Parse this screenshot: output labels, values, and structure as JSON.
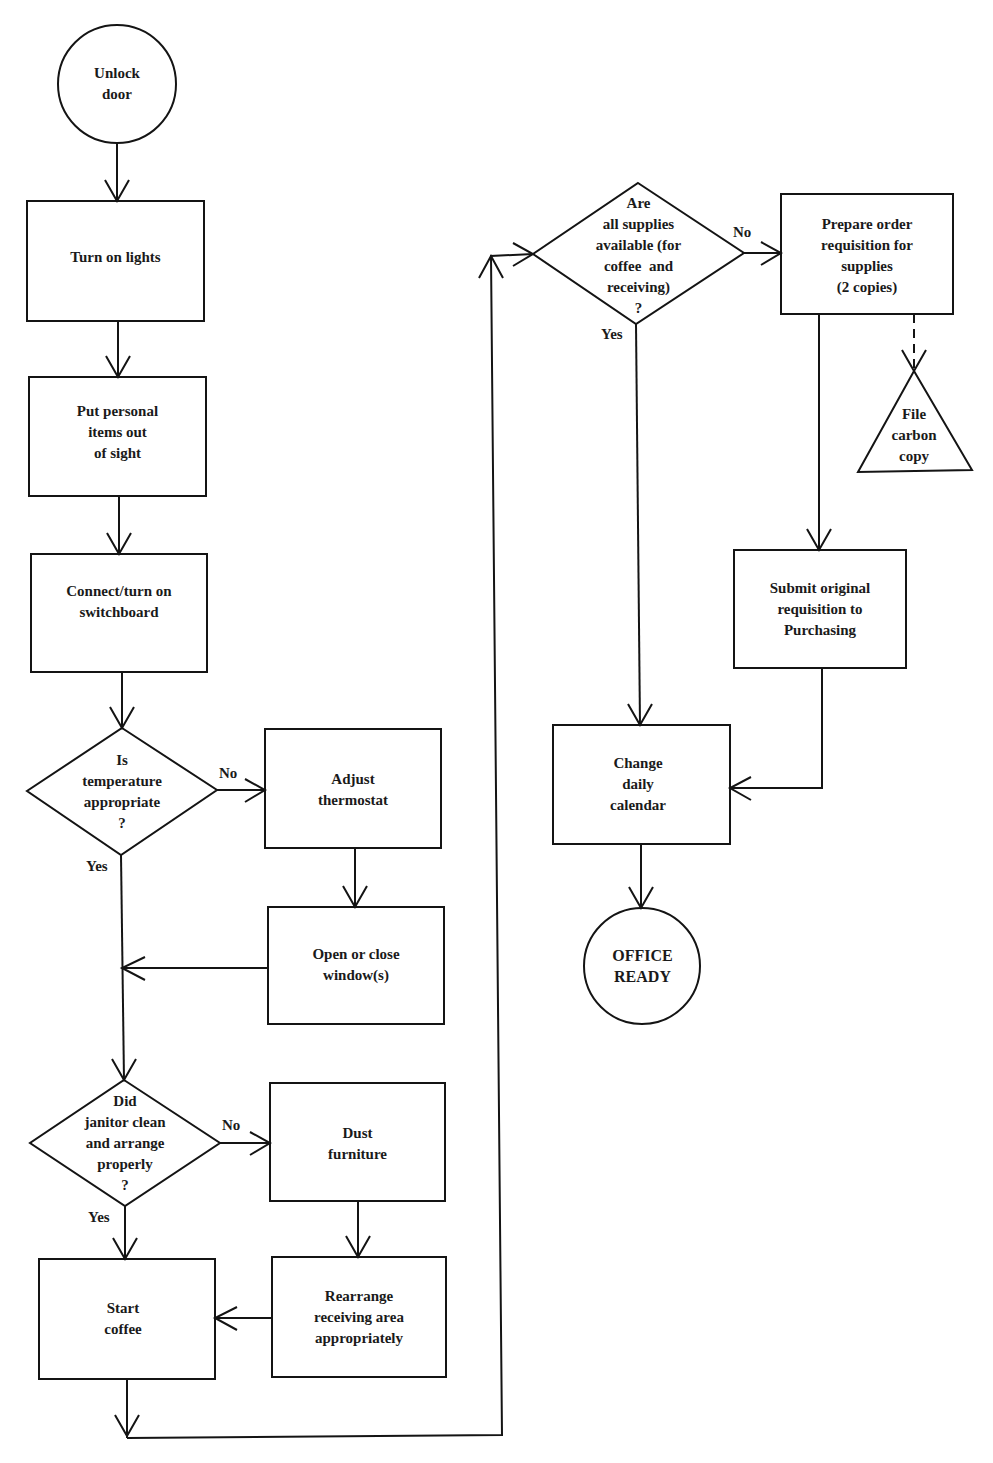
{
  "colors": {
    "ink": "#141414",
    "background": "#ffffff"
  },
  "nodes": {
    "unlock_door": {
      "type": "terminal",
      "lines": [
        "Unlock",
        "door"
      ]
    },
    "turn_on_lights": {
      "type": "process",
      "lines": [
        "Turn on lights"
      ]
    },
    "put_personal_items": {
      "type": "process",
      "lines": [
        "Put personal",
        "items out",
        "of sight"
      ]
    },
    "connect_switchboard": {
      "type": "process",
      "lines": [
        "Connect/turn on",
        "switchboard"
      ]
    },
    "temperature_decision": {
      "type": "decision",
      "lines": [
        "Is",
        "temperature",
        "appropriate",
        "?"
      ]
    },
    "adjust_thermostat": {
      "type": "process",
      "lines": [
        "Adjust",
        "thermostat"
      ]
    },
    "open_close_windows": {
      "type": "process",
      "lines": [
        "Open or close",
        "window(s)"
      ]
    },
    "janitor_decision": {
      "type": "decision",
      "lines": [
        "Did",
        "janitor clean",
        "and arrange",
        "properly",
        "?"
      ]
    },
    "dust_furniture": {
      "type": "process",
      "lines": [
        "Dust",
        "furniture"
      ]
    },
    "rearrange_receiving": {
      "type": "process",
      "lines": [
        "Rearrange",
        "receiving area",
        "appropriately"
      ]
    },
    "start_coffee": {
      "type": "process",
      "lines": [
        "Start",
        "coffee"
      ]
    },
    "supplies_decision": {
      "type": "decision",
      "lines": [
        "Are",
        "all supplies",
        "available (for",
        "coffee  and",
        "receiving)",
        "?"
      ]
    },
    "prepare_requisition": {
      "type": "process",
      "lines": [
        "Prepare order",
        "requisition for",
        "supplies",
        "(2 copies)"
      ]
    },
    "file_carbon_copy": {
      "type": "file",
      "lines": [
        "File",
        "carbon",
        "copy"
      ]
    },
    "submit_requisition": {
      "type": "process",
      "lines": [
        "Submit original",
        "requisition to",
        "Purchasing"
      ]
    },
    "change_calendar": {
      "type": "process",
      "lines": [
        "Change",
        "daily",
        "calendar"
      ]
    },
    "office_ready": {
      "type": "terminal",
      "lines": [
        "OFFICE",
        "READY"
      ]
    }
  },
  "edge_labels": {
    "temp_no": "No",
    "temp_yes": "Yes",
    "janitor_no": "No",
    "janitor_yes": "Yes",
    "supplies_no": "No",
    "supplies_yes": "Yes"
  },
  "edges": [
    {
      "from": "unlock_door",
      "to": "turn_on_lights"
    },
    {
      "from": "turn_on_lights",
      "to": "put_personal_items"
    },
    {
      "from": "put_personal_items",
      "to": "connect_switchboard"
    },
    {
      "from": "connect_switchboard",
      "to": "temperature_decision"
    },
    {
      "from": "temperature_decision",
      "to": "adjust_thermostat",
      "label": "No"
    },
    {
      "from": "temperature_decision",
      "to": "janitor_decision",
      "label": "Yes"
    },
    {
      "from": "adjust_thermostat",
      "to": "open_close_windows"
    },
    {
      "from": "open_close_windows",
      "to": "janitor_decision"
    },
    {
      "from": "janitor_decision",
      "to": "dust_furniture",
      "label": "No"
    },
    {
      "from": "janitor_decision",
      "to": "start_coffee",
      "label": "Yes"
    },
    {
      "from": "dust_furniture",
      "to": "rearrange_receiving"
    },
    {
      "from": "rearrange_receiving",
      "to": "start_coffee"
    },
    {
      "from": "start_coffee",
      "to": "supplies_decision"
    },
    {
      "from": "supplies_decision",
      "to": "prepare_requisition",
      "label": "No"
    },
    {
      "from": "supplies_decision",
      "to": "change_calendar",
      "label": "Yes"
    },
    {
      "from": "prepare_requisition",
      "to": "file_carbon_copy",
      "style": "dashed"
    },
    {
      "from": "prepare_requisition",
      "to": "submit_requisition"
    },
    {
      "from": "submit_requisition",
      "to": "change_calendar"
    },
    {
      "from": "change_calendar",
      "to": "office_ready"
    }
  ]
}
